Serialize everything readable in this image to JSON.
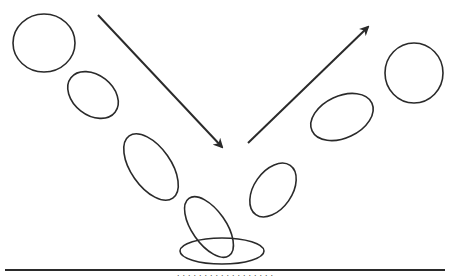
{
  "diagram": {
    "stroke_color": "#2a2a2a",
    "background": "#ffffff",
    "balls": [
      {
        "id": "ball-1",
        "cx": 44,
        "cy": 43,
        "rx": 31,
        "ry": 29,
        "rotate": 0,
        "phase": "falling"
      },
      {
        "id": "ball-2",
        "cx": 93,
        "cy": 95,
        "rx": 28,
        "ry": 20,
        "rotate": 38,
        "phase": "falling"
      },
      {
        "id": "ball-3",
        "cx": 151,
        "cy": 167,
        "rx": 38,
        "ry": 20,
        "rotate": 55,
        "phase": "falling"
      },
      {
        "id": "ball-4",
        "cx": 209,
        "cy": 227,
        "rx": 35,
        "ry": 17,
        "rotate": 55,
        "phase": "impact"
      },
      {
        "id": "ball-5",
        "cx": 222,
        "cy": 251,
        "rx": 42,
        "ry": 13,
        "rotate": 0,
        "phase": "squash"
      },
      {
        "id": "ball-6",
        "cx": 273,
        "cy": 190,
        "rx": 30,
        "ry": 19,
        "rotate": -55,
        "phase": "rebound"
      },
      {
        "id": "ball-7",
        "cx": 342,
        "cy": 117,
        "rx": 33,
        "ry": 21,
        "rotate": -25,
        "phase": "rebound"
      },
      {
        "id": "ball-8",
        "cx": 414,
        "cy": 73,
        "rx": 29,
        "ry": 30,
        "rotate": 0,
        "phase": "rising",
        "clipped": true
      }
    ],
    "arrows": [
      {
        "id": "arrow-incoming",
        "x1": 98,
        "y1": 15,
        "x2": 222,
        "y2": 147,
        "label": "incoming direction"
      },
      {
        "id": "arrow-outgoing",
        "x1": 248,
        "y1": 143,
        "x2": 368,
        "y2": 27,
        "label": "outgoing direction"
      }
    ],
    "ground": {
      "x1": 5,
      "x2": 445,
      "y": 270
    },
    "caption": "· · · · · · · · · · · · · · · · · ·"
  }
}
